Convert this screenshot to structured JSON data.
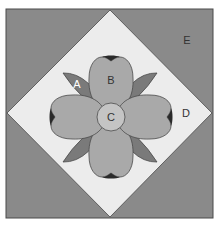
{
  "diagram": {
    "pieces": {
      "A": {
        "label": "A",
        "description": "leaf"
      },
      "B": {
        "label": "B",
        "description": "petal"
      },
      "C": {
        "label": "C",
        "description": "flower center"
      },
      "D": {
        "label": "D",
        "description": "center square background"
      },
      "E": {
        "label": "E",
        "description": "corner triangle"
      }
    },
    "colors": {
      "corner_triangle": "#8a8a8a",
      "background": "#ececec",
      "leaf": "#7a7a7a",
      "petal": "#a9a9a9",
      "center": "#c4c4c4",
      "petal_notch": "#2a2a2a",
      "outline": "#4a4a4a",
      "label_light": "#ffffff",
      "label_dark": "#333333"
    }
  }
}
